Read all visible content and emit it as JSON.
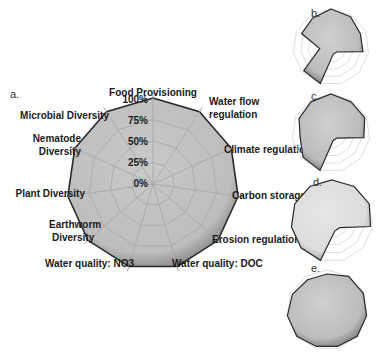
{
  "chart_data": [
    {
      "panel": "a.",
      "type": "radar",
      "axes": [
        "Food Provisioning",
        "Water flow regulation",
        "Climate regulation",
        "Carbon storage",
        "Erosion regulation",
        "Water quality: DOC",
        "Water quality: NO3",
        "Earthworm Diversity",
        "Plant Diversity",
        "Nematode Diversity",
        "Microbial Diversity"
      ],
      "axis_labels_display": [
        [
          "Food Provisioning"
        ],
        [
          "Water flow",
          "regulation"
        ],
        [
          "Climate regulation"
        ],
        [
          "Carbon storage"
        ],
        [
          "Erosion regulation"
        ],
        [
          "Water quality: DOC"
        ],
        [
          "Water quality: NO3"
        ],
        [
          "Earthworm",
          "Diversity"
        ],
        [
          "Plant Diversity"
        ],
        [
          "Nematode",
          "Diversity"
        ],
        [
          "Microbial Diversity"
        ]
      ],
      "radial_ticks": [
        "0%",
        "25%",
        "50%",
        "75%",
        "100%"
      ],
      "rlim": [
        0,
        100
      ],
      "values": [
        100,
        100,
        100,
        100,
        100,
        100,
        100,
        100,
        100,
        100,
        100
      ],
      "grid": true
    },
    {
      "panel": "b.",
      "type": "radar",
      "values": [
        100,
        95,
        85,
        85,
        20,
        20,
        100,
        95,
        30,
        85,
        90
      ],
      "rlim": [
        0,
        100
      ]
    },
    {
      "panel": "c.",
      "type": "radar",
      "values": [
        100,
        95,
        95,
        85,
        20,
        20,
        100,
        95,
        80,
        90,
        95
      ],
      "rlim": [
        0,
        100
      ]
    },
    {
      "panel": "d.",
      "type": "radar",
      "values": [
        100,
        100,
        100,
        95,
        25,
        25,
        100,
        100,
        100,
        100,
        100
      ],
      "rlim": [
        0,
        100
      ]
    },
    {
      "panel": "e.",
      "type": "radar",
      "values": [
        90,
        100,
        100,
        100,
        100,
        95,
        95,
        100,
        100,
        95,
        90
      ],
      "rlim": [
        0,
        100
      ]
    }
  ],
  "labels": {
    "a": "a.",
    "b": "b.",
    "c": "c.",
    "d": "d.",
    "e": "e."
  }
}
